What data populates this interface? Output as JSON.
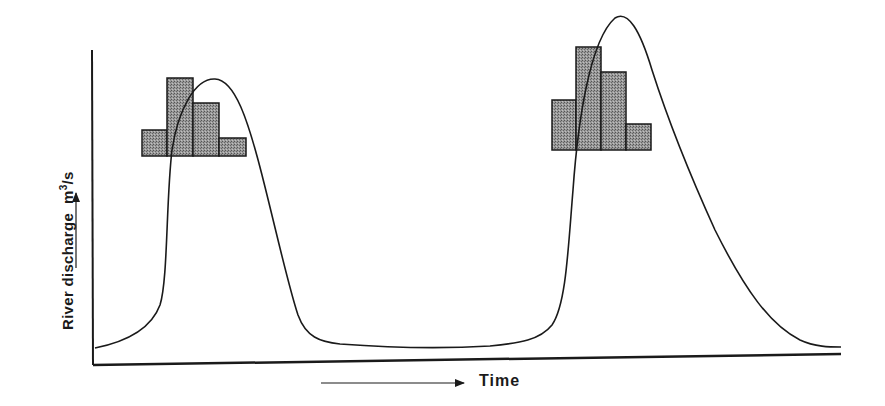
{
  "chart_data": {
    "type": "line",
    "title": "",
    "xlabel": "Time",
    "ylabel": "River discharge m3/s",
    "ylabel_main": "River discharge",
    "ylabel_unit_base": "m",
    "ylabel_unit_sup": "3",
    "ylabel_unit_tail": "/s",
    "axis_ticks": "none",
    "grid": false,
    "legend": null,
    "colors": {
      "line": "#1a1a1a",
      "bar_fill": "#8a8a8a",
      "bar_stroke": "#1a1a1a",
      "background": "#ffffff"
    },
    "series": [
      {
        "name": "Hydrograph (discharge)",
        "relative_points_px": [
          [
            95,
            348
          ],
          [
            140,
            335
          ],
          [
            160,
            310
          ],
          [
            168,
            240
          ],
          [
            175,
            140
          ],
          [
            190,
            90
          ],
          [
            215,
            79
          ],
          [
            235,
            95
          ],
          [
            260,
            170
          ],
          [
            280,
            250
          ],
          [
            295,
            315
          ],
          [
            310,
            338
          ],
          [
            340,
            345
          ],
          [
            440,
            348
          ],
          [
            500,
            345
          ],
          [
            530,
            340
          ],
          [
            555,
            320
          ],
          [
            570,
            260
          ],
          [
            578,
            150
          ],
          [
            595,
            60
          ],
          [
            619,
            17
          ],
          [
            640,
            40
          ],
          [
            660,
            90
          ],
          [
            700,
            185
          ],
          [
            740,
            270
          ],
          [
            780,
            320
          ],
          [
            810,
            342
          ],
          [
            841,
            347
          ]
        ],
        "peaks": [
          {
            "label": "first peak",
            "x_px": 215,
            "y_px": 79
          },
          {
            "label": "second peak",
            "x_px": 619,
            "y_px": 17
          }
        ]
      }
    ],
    "rainfall_histograms": [
      {
        "name": "Rainfall event 1",
        "bars_px": [
          {
            "x0": 142,
            "x1": 167,
            "top": 130,
            "bottom": 156
          },
          {
            "x0": 167,
            "x1": 193,
            "top": 78,
            "bottom": 156
          },
          {
            "x0": 193,
            "x1": 219,
            "top": 103,
            "bottom": 156
          },
          {
            "x0": 219,
            "x1": 246,
            "top": 138,
            "bottom": 156
          }
        ],
        "relative_heights": [
          26,
          78,
          53,
          18
        ]
      },
      {
        "name": "Rainfall event 2",
        "bars_px": [
          {
            "x0": 552,
            "x1": 576,
            "top": 100,
            "bottom": 150
          },
          {
            "x0": 576,
            "x1": 601,
            "top": 47,
            "bottom": 150
          },
          {
            "x0": 601,
            "x1": 626,
            "top": 72,
            "bottom": 150
          },
          {
            "x0": 626,
            "x1": 651,
            "top": 124,
            "bottom": 150
          }
        ],
        "relative_heights": [
          50,
          103,
          78,
          26
        ]
      }
    ],
    "axes": {
      "y_axis": {
        "x": 92,
        "top": 50,
        "bottom": 365
      },
      "x_axis": {
        "left": 92,
        "right": 841,
        "y_left": 365,
        "y_right": 354
      }
    },
    "arrows": {
      "y_arrow": {
        "x": 70,
        "y_from": 265,
        "y_to": 192
      },
      "x_arrow": {
        "y": 383,
        "x_from": 321,
        "x_to": 464
      }
    }
  }
}
